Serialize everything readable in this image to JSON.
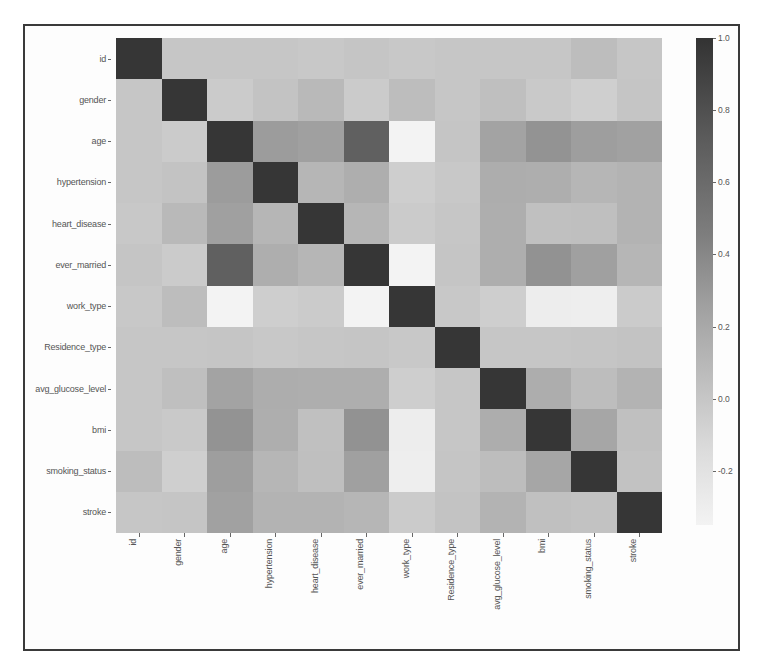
{
  "chart_data": {
    "type": "heatmap",
    "title": "",
    "xlabel": "",
    "ylabel": "",
    "rows": [
      "id",
      "gender",
      "age",
      "hypertension",
      "heart_disease",
      "ever_married",
      "work_type",
      "Residence_type",
      "avg_glucose_level",
      "bmi",
      "smoking_status",
      "stroke"
    ],
    "columns": [
      "id",
      "gender",
      "age",
      "hypertension",
      "heart_disease",
      "ever_married",
      "work_type",
      "Residence_type",
      "avg_glucose_level",
      "bmi",
      "smoking_status",
      "stroke"
    ],
    "values": [
      [
        1.0,
        0.0,
        0.0,
        0.0,
        -0.01,
        0.01,
        -0.01,
        0.0,
        0.0,
        0.0,
        0.06,
        0.0
      ],
      [
        0.0,
        1.0,
        -0.03,
        0.02,
        0.09,
        -0.03,
        0.06,
        0.0,
        0.05,
        -0.02,
        -0.06,
        0.01
      ],
      [
        0.0,
        -0.03,
        1.0,
        0.28,
        0.26,
        0.68,
        -0.36,
        0.01,
        0.24,
        0.33,
        0.27,
        0.25
      ],
      [
        0.0,
        0.02,
        0.28,
        1.0,
        0.11,
        0.16,
        -0.05,
        -0.01,
        0.17,
        0.16,
        0.11,
        0.13
      ],
      [
        -0.01,
        0.09,
        0.26,
        0.11,
        1.0,
        0.11,
        -0.03,
        0.0,
        0.16,
        0.04,
        0.05,
        0.13
      ],
      [
        0.01,
        -0.03,
        0.68,
        0.16,
        0.11,
        1.0,
        -0.35,
        0.01,
        0.16,
        0.34,
        0.26,
        0.11
      ],
      [
        -0.01,
        0.06,
        -0.36,
        -0.05,
        -0.03,
        -0.35,
        1.0,
        -0.01,
        -0.05,
        -0.3,
        -0.31,
        -0.03
      ],
      [
        0.0,
        0.0,
        0.01,
        -0.01,
        0.0,
        0.01,
        -0.01,
        1.0,
        0.0,
        0.0,
        0.01,
        0.02
      ],
      [
        0.0,
        0.05,
        0.24,
        0.17,
        0.16,
        0.16,
        -0.05,
        0.0,
        1.0,
        0.17,
        0.06,
        0.13
      ],
      [
        0.0,
        -0.02,
        0.33,
        0.16,
        0.04,
        0.34,
        -0.3,
        0.0,
        0.17,
        1.0,
        0.22,
        0.04
      ],
      [
        0.06,
        -0.06,
        0.27,
        0.11,
        0.05,
        0.26,
        -0.31,
        0.01,
        0.06,
        0.22,
        1.0,
        0.03
      ],
      [
        0.0,
        0.01,
        0.25,
        0.13,
        0.13,
        0.11,
        -0.03,
        0.02,
        0.13,
        0.04,
        0.03,
        1.0
      ]
    ],
    "colorbar": {
      "ticks": [
        "1.0",
        "0.8",
        "0.6",
        "0.4",
        "0.2",
        "0.0",
        "-0.2"
      ],
      "range": [
        -0.35,
        1.0
      ],
      "colormap": "greys (light = low, dark = high)"
    },
    "colors": {
      "low": "#f3f3f3",
      "high": "#333333"
    }
  }
}
